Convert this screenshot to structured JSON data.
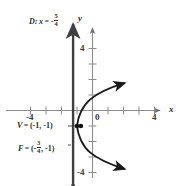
{
  "figure": {
    "title_visible": false,
    "axes": {
      "x_axis_name": "x",
      "y_axis_name": "y",
      "x_ticks": [
        {
          "value": -4,
          "label": "-4"
        },
        {
          "value": -3,
          "label": ""
        },
        {
          "value": -2,
          "label": ""
        },
        {
          "value": -1,
          "label": ""
        },
        {
          "value": 1,
          "label": ""
        },
        {
          "value": 2,
          "label": ""
        },
        {
          "value": 3,
          "label": ""
        },
        {
          "value": 4,
          "label": "4"
        }
      ],
      "y_ticks": [
        {
          "value": 4,
          "label": "4"
        },
        {
          "value": 3,
          "label": ""
        },
        {
          "value": 2,
          "label": ""
        },
        {
          "value": 1,
          "label": ""
        },
        {
          "value": -1,
          "label": ""
        },
        {
          "value": -2,
          "label": ""
        },
        {
          "value": -3,
          "label": ""
        },
        {
          "value": -4,
          "label": "-4"
        }
      ],
      "origin_label": "0",
      "xlim": [
        -4.7,
        4.7
      ],
      "ylim": [
        -4.9,
        4.9
      ]
    },
    "directrix": {
      "prefix": "D:",
      "variable": "x",
      "equals": "= -",
      "numerator": "5",
      "denominator": "4",
      "x_value": -1.25,
      "color": "#3f3f3f"
    },
    "vertex": {
      "symbol": "V",
      "equals": "=",
      "coords": "(-1, -1)",
      "x": -1,
      "y": -1
    },
    "focus": {
      "symbol": "F",
      "equals": "=",
      "open_paren": "(-",
      "numerator": "3",
      "denominator": "4",
      "close": ", -1)",
      "x": -0.75,
      "y": -1
    },
    "curve": {
      "type": "parabola",
      "orientation": "opens-right",
      "equation_form": "(y + 1)^2 = 4p(x + 1)",
      "p": 0.25,
      "color": "#1a1a1a"
    }
  }
}
